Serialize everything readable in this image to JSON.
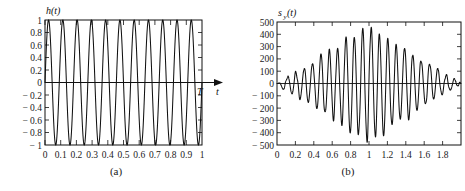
{
  "figure": {
    "background_color": "#ffffff",
    "line_color": "#111111",
    "panels": [
      {
        "id": "panel-a",
        "caption": "(a)",
        "ylabel": "h(t)",
        "xlabel": "t",
        "x_axis_end_marker": "T"
      },
      {
        "id": "panel-b",
        "caption": "(b)",
        "ylabel": "s",
        "ylabel_sub": "y",
        "ylabel_tail": "(t)",
        "xlabel": ""
      }
    ]
  },
  "chart_data": [
    {
      "type": "line",
      "id": "panel-a",
      "title": "",
      "xlabel": "t",
      "ylabel": "h(t)",
      "xlim": [
        0,
        1
      ],
      "ylim": [
        -1,
        1
      ],
      "grid": false,
      "legend": "none",
      "xticks": [
        0,
        0.1,
        0.2,
        0.3,
        0.4,
        0.5,
        0.6,
        0.7,
        0.8,
        0.9,
        1
      ],
      "xticklabels": [
        "0",
        "0.1",
        "0.2",
        "0.3",
        "0.4",
        "0.5",
        "0.6",
        "0.7",
        "0.8",
        "0.9",
        "1"
      ],
      "yticks": [
        1,
        0.8,
        0.6,
        0.4,
        0.2,
        0,
        -0.2,
        -0.4,
        -0.6,
        -0.8,
        -1
      ],
      "yticklabels": [
        "1",
        "0.8",
        "0.6",
        "0.4",
        "0.2",
        "0",
        "− 0.2",
        "− 0.4",
        "− 0.6",
        "− 0.8",
        "− 1"
      ],
      "annotations": [
        "T",
        "t"
      ],
      "description": "Sinusoidal carrier pulse, 11 cycles over duration T = 1, amplitude 1",
      "waveform": {
        "form": "sine",
        "amplitude": 1,
        "cycles": 11,
        "frequency_hz": 11,
        "phase": 0,
        "duration": 1
      }
    },
    {
      "type": "line",
      "id": "panel-b",
      "title": "",
      "xlabel": "",
      "ylabel": "s_y(t)",
      "xlim": [
        0,
        2
      ],
      "ylim": [
        -500,
        500
      ],
      "grid": false,
      "legend": "none",
      "xticks": [
        0,
        0.2,
        0.4,
        0.6,
        0.8,
        1,
        1.2,
        1.4,
        1.6,
        1.8
      ],
      "xticklabels": [
        "0",
        "0.2",
        "0.4",
        "0.6",
        "0.8",
        "1",
        "1.2",
        "1.4",
        "1.6",
        "1.8"
      ],
      "yticks": [
        500,
        400,
        300,
        200,
        100,
        0,
        -100,
        -200,
        -300,
        -400,
        -500
      ],
      "yticklabels": [
        "500",
        "400",
        "300",
        "200",
        "100",
        "0",
        "− 100",
        "− 200",
        "− 300",
        "− 400",
        "− 500"
      ],
      "description": "Matched-filter / autocorrelation output: oscillation at 11 Hz with triangular envelope peaking near t = 1 at about 470",
      "waveform": {
        "form": "triangular-envelope-sine",
        "peak_value": 470,
        "peak_time": 1.0,
        "frequency_hz": 11,
        "envelope_start": 0,
        "envelope_end": 2,
        "noise_amplitude": 35
      }
    }
  ]
}
